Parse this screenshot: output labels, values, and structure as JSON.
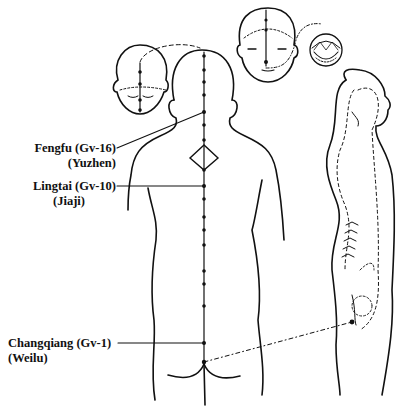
{
  "figure": {
    "points": [
      {
        "name": "Fengfu (Gv-16)",
        "alt": "(Yuzhen)"
      },
      {
        "name": "Lingtai (Gv-10)",
        "alt": "(Jiaji)"
      },
      {
        "name": "Changqiang (Gv-1)",
        "alt": "(Weilu)"
      }
    ],
    "colors": {
      "line": "#111111",
      "background": "#ffffff"
    }
  }
}
